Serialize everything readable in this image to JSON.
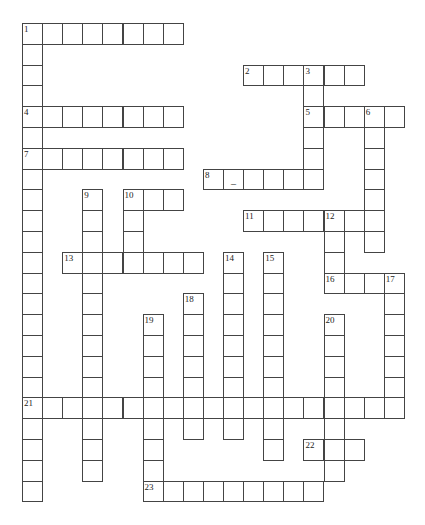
{
  "puzzle": {
    "type": "crossword",
    "grid": {
      "cols": 19,
      "rows": 23,
      "origin_x": 22,
      "origin_y": 23,
      "cell_w": 20.1,
      "cell_h": 20.8
    },
    "entries": [
      {
        "number": 1,
        "dir": "across",
        "row": 0,
        "col": 0,
        "length": 8
      },
      {
        "number": 1,
        "dir": "down",
        "row": 0,
        "col": 0,
        "length": 23
      },
      {
        "number": 2,
        "dir": "across",
        "row": 2,
        "col": 11,
        "length": 6
      },
      {
        "number": 3,
        "dir": "down",
        "row": 2,
        "col": 14,
        "length": 6
      },
      {
        "number": 4,
        "dir": "across",
        "row": 4,
        "col": 0,
        "length": 8
      },
      {
        "number": 5,
        "dir": "across",
        "row": 4,
        "col": 14,
        "length": 5
      },
      {
        "number": 6,
        "dir": "down",
        "row": 4,
        "col": 17,
        "length": 7
      },
      {
        "number": 7,
        "dir": "across",
        "row": 6,
        "col": 0,
        "length": 8
      },
      {
        "number": 8,
        "dir": "across",
        "row": 7,
        "col": 9,
        "length": 6
      },
      {
        "number": 9,
        "dir": "down",
        "row": 8,
        "col": 3,
        "length": 14
      },
      {
        "number": 10,
        "dir": "across",
        "row": 8,
        "col": 5,
        "length": 3
      },
      {
        "number": 10,
        "dir": "down",
        "row": 8,
        "col": 5,
        "length": 4
      },
      {
        "number": 11,
        "dir": "across",
        "row": 9,
        "col": 11,
        "length": 7
      },
      {
        "number": 12,
        "dir": "down",
        "row": 9,
        "col": 15,
        "length": 4
      },
      {
        "number": 13,
        "dir": "across",
        "row": 11,
        "col": 2,
        "length": 7
      },
      {
        "number": 14,
        "dir": "down",
        "row": 11,
        "col": 10,
        "length": 9
      },
      {
        "number": 15,
        "dir": "down",
        "row": 11,
        "col": 12,
        "length": 10
      },
      {
        "number": 16,
        "dir": "across",
        "row": 12,
        "col": 15,
        "length": 4
      },
      {
        "number": 17,
        "dir": "down",
        "row": 12,
        "col": 18,
        "length": 7
      },
      {
        "number": 18,
        "dir": "down",
        "row": 13,
        "col": 8,
        "length": 7
      },
      {
        "number": 19,
        "dir": "down",
        "row": 14,
        "col": 6,
        "length": 9
      },
      {
        "number": 20,
        "dir": "down",
        "row": 14,
        "col": 15,
        "length": 8
      },
      {
        "number": 21,
        "dir": "across",
        "row": 18,
        "col": 0,
        "length": 19
      },
      {
        "number": 22,
        "dir": "across",
        "row": 20,
        "col": 14,
        "length": 3
      },
      {
        "number": 23,
        "dir": "across",
        "row": 22,
        "col": 6,
        "length": 9
      }
    ],
    "prefilled": [
      {
        "row": 7,
        "col": 10,
        "text": "_"
      }
    ]
  }
}
